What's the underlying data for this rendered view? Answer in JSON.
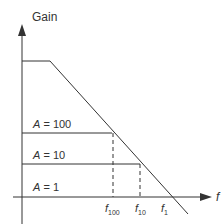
{
  "diagram": {
    "y_axis_label": "Gain",
    "x_axis_label": "f",
    "gain_levels": [
      {
        "label_var": "A",
        "label_eq": " = 100"
      },
      {
        "label_var": "A",
        "label_eq": " = 10"
      },
      {
        "label_var": "A",
        "label_eq": " = 1"
      }
    ],
    "frequency_marks": [
      {
        "var": "f",
        "sub": "100"
      },
      {
        "var": "f",
        "sub": "10"
      },
      {
        "var": "f",
        "sub": "1"
      }
    ],
    "colors": {
      "line": "#333333",
      "background": "#ffffff"
    }
  }
}
